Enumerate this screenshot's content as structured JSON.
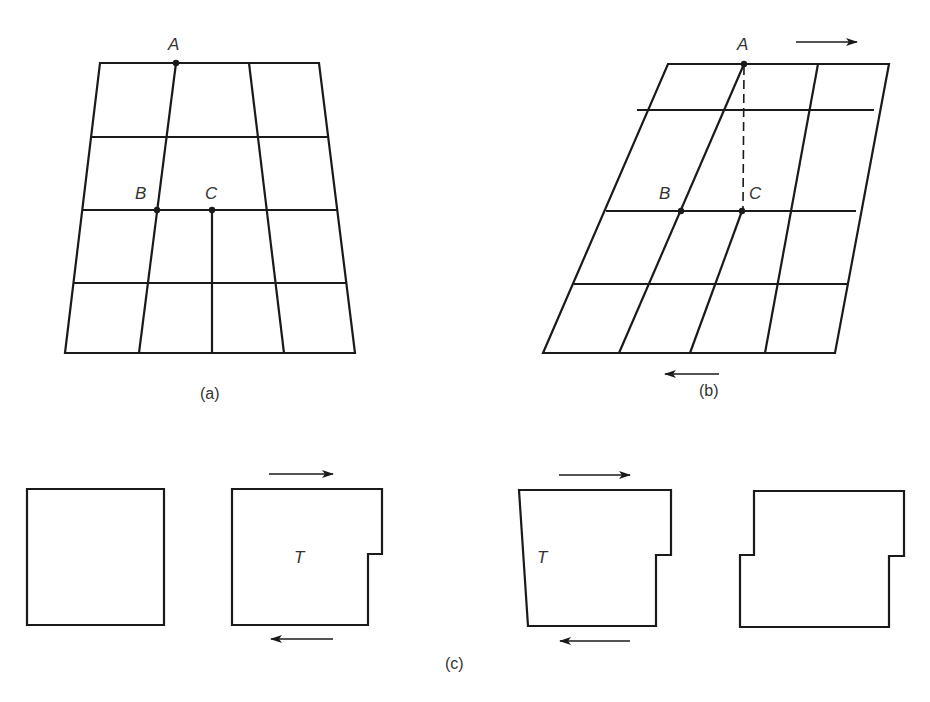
{
  "figure": {
    "panels": {
      "a": {
        "caption": "(a)",
        "description": "Undeformed tapered grid (4x4 cells) with points A, B, C",
        "point_labels": {
          "A": "A",
          "B": "B",
          "C": "C"
        },
        "dashed_line": false
      },
      "b": {
        "caption": "(b)",
        "description": "Grid sheared by opposing forces; dashed line from A to C",
        "point_labels": {
          "A": "A",
          "B": "B",
          "C": "C"
        },
        "dashed_line": true,
        "arrows": [
          {
            "position": "top",
            "direction": "right"
          },
          {
            "position": "bottom",
            "direction": "left"
          }
        ]
      },
      "c": {
        "caption": "(c)",
        "shapes": [
          {
            "id": "square",
            "label": ""
          },
          {
            "id": "notched-right",
            "label": "T",
            "arrows": [
              "top-right",
              "bottom-left"
            ]
          },
          {
            "id": "notched-right-tapered",
            "label": "T",
            "arrows": [
              "top-right",
              "bottom-left"
            ]
          },
          {
            "id": "notched-both",
            "label": ""
          }
        ]
      }
    },
    "colors": {
      "line": "#1a1a1a",
      "text": "#333333",
      "background": "#ffffff"
    }
  }
}
